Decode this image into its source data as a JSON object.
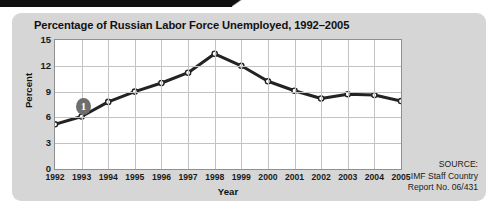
{
  "figure": {
    "title": "Percentage of Russian Labor Force Unemployed, 1992–2005",
    "annotation_badge": "1",
    "source": {
      "line1": "SOURCE:",
      "line2": "IMF Staff Country",
      "line3": "Report No. 06/431"
    }
  },
  "colors": {
    "panel_background": "#d6d6d6",
    "plot_background": "#ffffff",
    "gridline": "#c3c3c3",
    "axis_border": "#8f8f8f",
    "line_series": "#232323",
    "marker_fill": "#ffffff",
    "badge_fill": "#6e6e6e",
    "top_bar": "#101010",
    "text": "#111111"
  },
  "chart_data": {
    "type": "line",
    "title": "Percentage of Russian Labor Force Unemployed, 1992–2005",
    "xlabel": "Year",
    "ylabel": "Percent",
    "categories": [
      "1992",
      "1993",
      "1994",
      "1995",
      "1996",
      "1997",
      "1998",
      "1999",
      "2000",
      "2001",
      "2002",
      "2003",
      "2004",
      "2005"
    ],
    "values": [
      5.2,
      6.1,
      7.8,
      9.0,
      10.0,
      11.2,
      13.4,
      12.0,
      10.2,
      9.1,
      8.2,
      8.7,
      8.6,
      7.9
    ],
    "ylim": [
      0,
      15
    ],
    "yticks": [
      0,
      3,
      6,
      9,
      12,
      15
    ],
    "ytick_labels": [
      "0",
      "3",
      "6",
      "9",
      "12",
      "15"
    ],
    "grid": true,
    "legend": "none",
    "marker": "open-circle",
    "annotations": [
      {
        "label": "1",
        "near_category": "1993",
        "shape": "filled-circle"
      }
    ]
  }
}
